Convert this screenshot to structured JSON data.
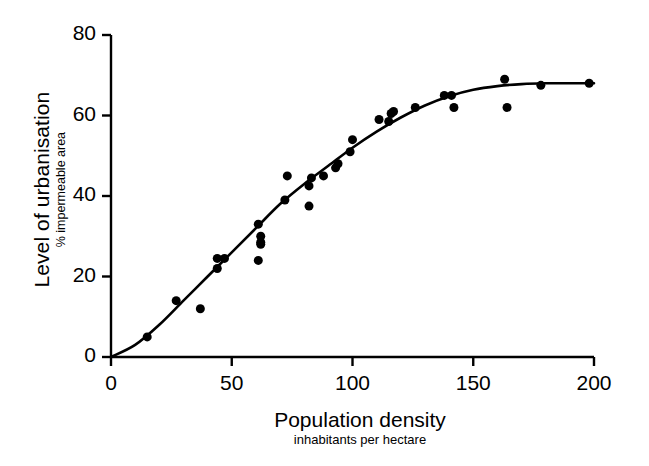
{
  "chart_data": {
    "type": "scatter",
    "title": "",
    "xlabel": "Population density",
    "xlabel_sub": "inhabitants per hectare",
    "ylabel": "Level of urbanisation",
    "ylabel_sub": "% impermeable area",
    "xlim": [
      0,
      200
    ],
    "ylim": [
      0,
      80
    ],
    "xticks": [
      0,
      50,
      100,
      150,
      200
    ],
    "yticks": [
      0,
      20,
      40,
      60,
      80
    ],
    "xtick_labels": [
      "0",
      "50",
      "100",
      "150",
      "200"
    ],
    "ytick_labels": [
      "0",
      "20",
      "40",
      "60",
      "80"
    ],
    "grid": false,
    "legend": false,
    "marker": "filled-circle",
    "marker_color": "#000000",
    "marker_size_px": 9,
    "line_color": "#000000",
    "line_width_px": 2.6,
    "axis_color": "#000000",
    "background_color": "#ffffff",
    "points": [
      {
        "x": 15,
        "y": 5
      },
      {
        "x": 27,
        "y": 14
      },
      {
        "x": 37,
        "y": 12
      },
      {
        "x": 44,
        "y": 22
      },
      {
        "x": 44,
        "y": 24.5
      },
      {
        "x": 47,
        "y": 24.5
      },
      {
        "x": 61,
        "y": 24
      },
      {
        "x": 61,
        "y": 33
      },
      {
        "x": 62,
        "y": 30
      },
      {
        "x": 62,
        "y": 28.5
      },
      {
        "x": 62,
        "y": 28
      },
      {
        "x": 72,
        "y": 39
      },
      {
        "x": 73,
        "y": 45
      },
      {
        "x": 82,
        "y": 37.5
      },
      {
        "x": 82,
        "y": 42.5
      },
      {
        "x": 83,
        "y": 44.5
      },
      {
        "x": 88,
        "y": 45
      },
      {
        "x": 93,
        "y": 47
      },
      {
        "x": 94,
        "y": 48
      },
      {
        "x": 99,
        "y": 51
      },
      {
        "x": 100,
        "y": 54
      },
      {
        "x": 111,
        "y": 59
      },
      {
        "x": 115,
        "y": 58.5
      },
      {
        "x": 116,
        "y": 60.5
      },
      {
        "x": 117,
        "y": 61
      },
      {
        "x": 126,
        "y": 62
      },
      {
        "x": 138,
        "y": 65
      },
      {
        "x": 141,
        "y": 65
      },
      {
        "x": 142,
        "y": 62
      },
      {
        "x": 163,
        "y": 69
      },
      {
        "x": 164,
        "y": 62
      },
      {
        "x": 178,
        "y": 67.5
      },
      {
        "x": 198,
        "y": 68
      }
    ],
    "fit_curve": {
      "description": "sigmoid fitted curve from origin to plateau near 68",
      "points": [
        {
          "x": 0,
          "y": 0
        },
        {
          "x": 10,
          "y": 3
        },
        {
          "x": 20,
          "y": 8
        },
        {
          "x": 30,
          "y": 14
        },
        {
          "x": 40,
          "y": 20
        },
        {
          "x": 50,
          "y": 26
        },
        {
          "x": 60,
          "y": 32
        },
        {
          "x": 70,
          "y": 38
        },
        {
          "x": 80,
          "y": 43
        },
        {
          "x": 90,
          "y": 47.5
        },
        {
          "x": 100,
          "y": 52
        },
        {
          "x": 110,
          "y": 56
        },
        {
          "x": 120,
          "y": 59.5
        },
        {
          "x": 130,
          "y": 62.5
        },
        {
          "x": 140,
          "y": 64.8
        },
        {
          "x": 150,
          "y": 66.4
        },
        {
          "x": 160,
          "y": 67.3
        },
        {
          "x": 170,
          "y": 67.8
        },
        {
          "x": 180,
          "y": 68
        },
        {
          "x": 190,
          "y": 68
        },
        {
          "x": 200,
          "y": 68
        }
      ]
    }
  }
}
